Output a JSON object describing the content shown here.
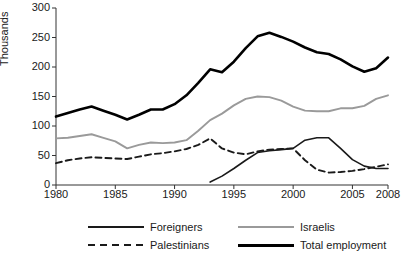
{
  "chart_data": {
    "type": "line",
    "title": "",
    "xlabel": "",
    "ylabel": "Thousands",
    "xlim": [
      1980,
      2008
    ],
    "ylim": [
      0,
      300
    ],
    "grid": false,
    "legend_position": "bottom",
    "x_ticks": [
      1980,
      1985,
      1990,
      1995,
      2000,
      2005,
      2008
    ],
    "y_ticks": [
      0,
      50,
      100,
      150,
      200,
      250,
      300
    ],
    "x": [
      1980,
      1981,
      1982,
      1983,
      1984,
      1985,
      1986,
      1987,
      1988,
      1989,
      1990,
      1991,
      1992,
      1993,
      1994,
      1995,
      1996,
      1997,
      1998,
      1999,
      2000,
      2001,
      2002,
      2003,
      2004,
      2005,
      2006,
      2007,
      2008
    ],
    "series": [
      {
        "name": "Total employment",
        "color": "#000000",
        "style": "solid",
        "width": 2.6,
        "values": [
          116,
          122,
          128,
          133,
          126,
          119,
          111,
          119,
          128,
          128,
          137,
          152,
          173,
          196,
          191,
          209,
          232,
          252,
          258,
          251,
          243,
          233,
          225,
          222,
          213,
          201,
          192,
          198,
          216
        ]
      },
      {
        "name": "Israelis",
        "color": "#9a9a9a",
        "style": "solid",
        "width": 1.9,
        "values": [
          79,
          80,
          83,
          86,
          80,
          74,
          62,
          68,
          72,
          71,
          72,
          76,
          92,
          110,
          121,
          135,
          146,
          150,
          149,
          143,
          133,
          126,
          125,
          125,
          130,
          130,
          134,
          146,
          152
        ]
      },
      {
        "name": "Foreigners",
        "color": "#1a1a1a",
        "style": "solid",
        "width": 1.6,
        "values": [
          null,
          null,
          null,
          null,
          null,
          null,
          null,
          null,
          null,
          null,
          null,
          null,
          null,
          5,
          15,
          28,
          42,
          55,
          58,
          60,
          62,
          76,
          80,
          80,
          62,
          43,
          32,
          28,
          28
        ]
      },
      {
        "name": "Palestinians",
        "color": "#1a1a1a",
        "style": "dashed",
        "width": 1.9,
        "values": [
          37,
          42,
          45,
          47,
          46,
          45,
          44,
          48,
          52,
          54,
          57,
          61,
          68,
          79,
          62,
          55,
          52,
          57,
          60,
          61,
          62,
          42,
          26,
          21,
          22,
          24,
          27,
          31,
          35
        ]
      }
    ]
  },
  "axes": {
    "y_title": "Thousands",
    "y_tick_labels": [
      "300",
      "250",
      "200",
      "150",
      "100",
      "50",
      "0"
    ],
    "x_tick_labels": [
      "1980",
      "1985",
      "1990",
      "1995",
      "2000",
      "2005",
      "2008"
    ]
  },
  "legend": {
    "entries": [
      {
        "label": "Foreigners",
        "swatch": "thin-solid-black"
      },
      {
        "label": "Israelis",
        "swatch": "solid-gray"
      },
      {
        "label": "Palestinians",
        "swatch": "dashed-black"
      },
      {
        "label": "Total employment",
        "swatch": "thick-solid-black"
      }
    ]
  },
  "colors": {
    "axis": "#333333",
    "total_employment": "#000000",
    "israelis": "#9a9a9a",
    "foreigners": "#1a1a1a",
    "palestinians": "#1a1a1a",
    "background": "#ffffff"
  }
}
